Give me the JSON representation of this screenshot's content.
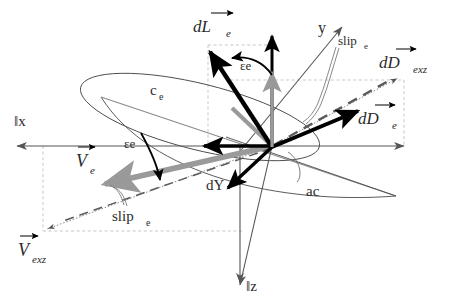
{
  "figure": {
    "background": "#ffffff",
    "width": 450,
    "height": 303,
    "colors": {
      "bold_vector": "#000000",
      "thin_axis": "#555555",
      "gray_vector": "#999999",
      "dashed_guide": "#b0b0b0",
      "outline": "#444444",
      "text": "#2b2b2b"
    }
  },
  "axes": [
    {
      "id": "x-axis",
      "label": "‖x",
      "direction": "left",
      "style": "solid-thin"
    },
    {
      "id": "y-axis",
      "label": "y",
      "direction": "up-right",
      "style": "solid-thin"
    },
    {
      "id": "z-axis",
      "label": "‖z",
      "direction": "down",
      "style": "solid-thin"
    },
    {
      "id": "x-right-axis",
      "label": "",
      "direction": "right",
      "style": "solid-thin"
    }
  ],
  "vectors": [
    {
      "id": "dLe",
      "label": "dL",
      "sub": "e",
      "vector_arrow": true,
      "weight": "bold",
      "color": "#000000",
      "direction": "up-left"
    },
    {
      "id": "dDe",
      "label": "dD",
      "sub": "e",
      "vector_arrow": true,
      "weight": "bold",
      "color": "#000000",
      "direction": "up-right"
    },
    {
      "id": "dDexz",
      "label": "dD",
      "sub": "exz",
      "vector_arrow": true,
      "weight": "thin",
      "color": "#555555",
      "direction": "up-right"
    },
    {
      "id": "Ve",
      "label": "V",
      "sub": "e",
      "vector_arrow": true,
      "weight": "thick",
      "color": "#999999",
      "direction": "down-left"
    },
    {
      "id": "Vexz",
      "label": "V",
      "sub": "exz",
      "vector_arrow": true,
      "weight": "thin",
      "color": "#555555",
      "direction": "down-left"
    },
    {
      "id": "dY",
      "label": "dY",
      "sub": "",
      "vector_arrow": false,
      "weight": "bold",
      "color": "#000000",
      "direction": "down-left"
    }
  ],
  "angles": [
    {
      "id": "epsilon-top",
      "label": "εe",
      "between": [
        "dLe",
        "vertical-axis"
      ]
    },
    {
      "id": "epsilon-left",
      "label": "εe",
      "between": [
        "chord",
        "Ve"
      ]
    }
  ],
  "annotations": [
    {
      "id": "chord",
      "label": "c",
      "sub": "e",
      "kind": "chord-line"
    },
    {
      "id": "slip-top",
      "label": "slip",
      "sub": "e",
      "kind": "leader-callout"
    },
    {
      "id": "slip-left",
      "label": "slip",
      "sub": "e",
      "kind": "leader-callout"
    },
    {
      "id": "ac",
      "label": "ac",
      "sub": "",
      "kind": "leader-callout"
    }
  ],
  "labels": {
    "dLe": {
      "main": "dL",
      "sub": "e",
      "arrow": true
    },
    "dDe": {
      "main": "dD",
      "sub": "e",
      "arrow": true
    },
    "dDexz": {
      "main": "dD",
      "sub": "exz",
      "arrow": true
    },
    "Ve": {
      "main": "V",
      "sub": "e",
      "arrow": true
    },
    "Vexz": {
      "main": "V",
      "sub": "exz",
      "arrow": true
    },
    "dY": {
      "main": "dY",
      "sub": "",
      "arrow": false
    },
    "chord": {
      "main": "c",
      "sub": "e",
      "arrow": false
    },
    "slip_top": {
      "main": "slip",
      "sub": "e",
      "arrow": false
    },
    "slip_left": {
      "main": "slip",
      "sub": "e",
      "arrow": false
    },
    "ac": {
      "main": "ac",
      "sub": "",
      "arrow": false
    },
    "epsilon_top": "εe",
    "epsilon_left": "εe",
    "axis_x": "‖x",
    "axis_y": "y",
    "axis_z": "‖z"
  }
}
